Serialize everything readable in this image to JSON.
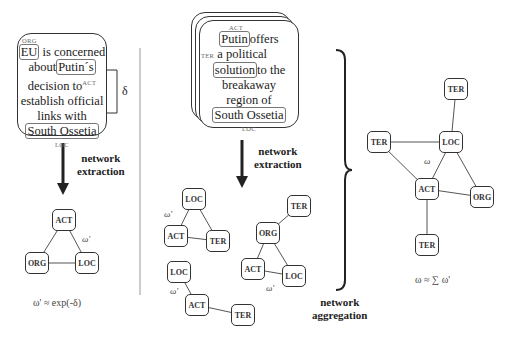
{
  "left_panel": {
    "document": {
      "tag_org": "ORG",
      "entity_eu": "EU",
      "text_1": "is concerned",
      "text_about": "about",
      "entity_putin": "Putin´s",
      "text_decision": "decision to",
      "tag_act": "ACT",
      "text_establish": "establish official",
      "text_links": "links with",
      "entity_south_ossetia": "South Ossetia",
      "tag_loc": "LOC"
    },
    "delta_label": "δ",
    "arrow_label_line1": "network",
    "arrow_label_line2": "extraction",
    "network": {
      "nodes": [
        "ACT",
        "ORG",
        "LOC"
      ],
      "edge_weight_label": "ω'"
    },
    "formula": "ω' ≈ exp(-δ)"
  },
  "middle_panel": {
    "document": {
      "tag_act": "ACT",
      "entity_putin": "Putin",
      "text_offers": "offers",
      "tag_ter": "TER",
      "text_political": "a political",
      "entity_solution": "solution",
      "text_to_the": "to the",
      "text_breakaway": "breakaway",
      "text_region": "region of",
      "entity_south_ossetia": "South Ossetia",
      "tag_loc": "LOC"
    },
    "arrow_label_line1": "network",
    "arrow_label_line2": "extraction",
    "networks": [
      {
        "nodes": [
          "LOC",
          "ACT",
          "TER"
        ],
        "weight_label": "ω'"
      },
      {
        "nodes": [
          "TER",
          "ORG",
          "ACT",
          "LOC"
        ],
        "weight_label": "ω'"
      },
      {
        "nodes": [
          "LOC",
          "ACT",
          "TER"
        ],
        "weight_label": "ω'"
      }
    ]
  },
  "aggregation": {
    "label_line1": "network",
    "label_line2": "aggregation"
  },
  "right_panel": {
    "network": {
      "nodes": [
        "TER",
        "TER",
        "LOC",
        "ACT",
        "ORG",
        "TER"
      ],
      "edge_weight_label": "ω"
    },
    "formula": "ω ≈ ∑ ω'"
  }
}
